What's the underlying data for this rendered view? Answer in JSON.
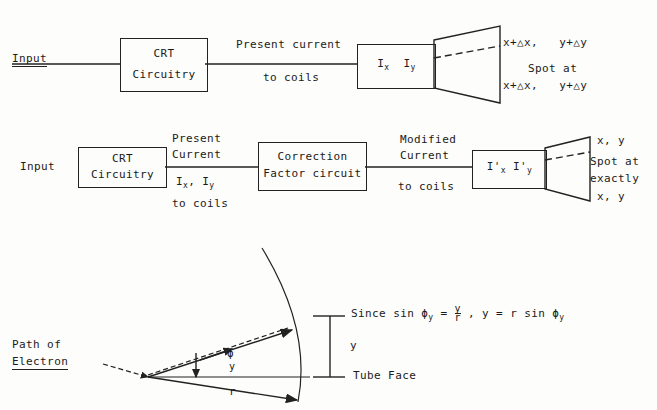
{
  "diagram": {
    "row1": {
      "input_label": "Input",
      "crt_box": "CRT\nCircuitry",
      "wire_label_top": "Present current",
      "wire_label_bottom": "to coils",
      "coil_box_i": "I",
      "coil_box_x": "x",
      "coil_box_i2": "I",
      "coil_box_y": "y",
      "spot_top": "x+△x,   y+△y",
      "spot_mid": "Spot at",
      "spot_bottom": "x+△x,   y+△y"
    },
    "row2": {
      "input_label": "Input",
      "crt_box": "CRT\nCircuitry",
      "wire1_top": "Present",
      "wire1_top2": "Current",
      "wire1_sub": "I",
      "wire1_sub_x": "x",
      "wire1_sub_comma": ", I",
      "wire1_sub_y": "y",
      "wire1_bottom": "to coils",
      "correction_box": "Correction\nFactor circuit",
      "wire2_top": "Modified",
      "wire2_top2": "Current",
      "wire2_bottom": "to coils",
      "coil_box_i": "I'",
      "coil_box_x": "x",
      "coil_box_i2": "I'",
      "coil_box_y": "y",
      "spot_l1": "x, y",
      "spot_l2": "Spot at",
      "spot_l3": "exactly",
      "spot_l4": "x, y"
    },
    "row3": {
      "path_label_1": "Path of",
      "path_label_2": "Electron",
      "angle_phi": "ϕ",
      "angle_sub": "y",
      "radius_label": "r",
      "height_label": "y",
      "tube_face_label": "Tube Face",
      "formula_1": "Since sin ",
      "formula_phi": "ϕ",
      "formula_phi_sub": "y",
      "formula_2": " = ",
      "formula_frac_num": "y",
      "formula_frac_den": "r",
      "formula_3": " , y = r sin ",
      "formula_phi2": "ϕ",
      "formula_phi2_sub": "y"
    }
  },
  "colors": {
    "ink": "#222222",
    "paper": "#fdfdfb"
  }
}
